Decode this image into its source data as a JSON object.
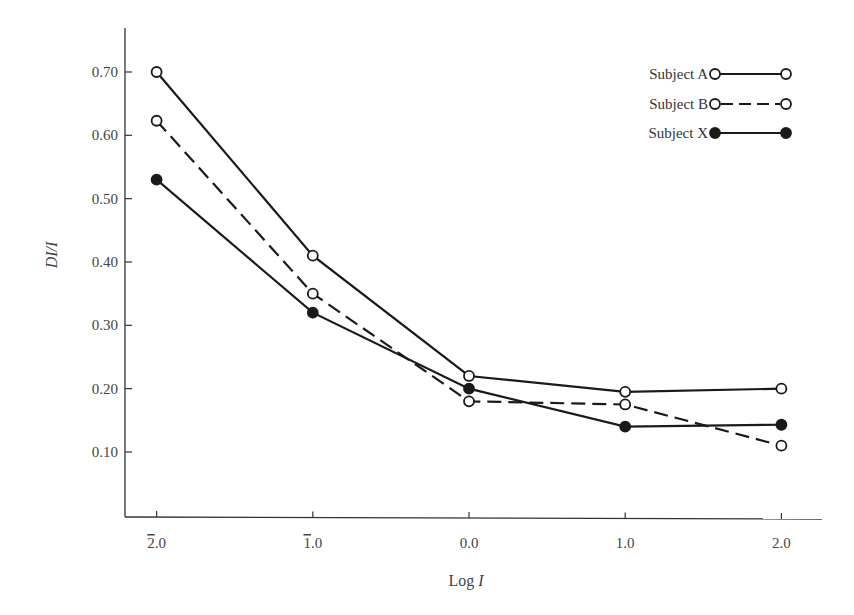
{
  "chart_data": {
    "type": "line",
    "title": "",
    "xlabel": "Log I",
    "ylabel": "DI/I",
    "x": [
      -2.0,
      -1.0,
      0.0,
      1.0,
      2.0
    ],
    "x_tick_labels": [
      "2̄.0",
      "1̄.0",
      "0.0",
      "1.0",
      "2.0"
    ],
    "y_ticks": [
      0.1,
      0.2,
      0.3,
      0.4,
      0.5,
      0.6,
      0.7
    ],
    "y_tick_labels": [
      "0.10",
      "0.20",
      "0.30",
      "0.40",
      "0.50",
      "0.60",
      "0.70"
    ],
    "ylim": [
      0.0,
      0.77
    ],
    "xlim": [
      -2.2,
      2.25
    ],
    "grid": false,
    "legend_position": "upper right",
    "series": [
      {
        "name": "Subject A",
        "values": [
          0.7,
          0.41,
          0.22,
          0.195,
          0.2
        ],
        "marker": "open-circle",
        "line": "solid"
      },
      {
        "name": "Subject B",
        "values": [
          0.623,
          0.35,
          0.18,
          0.175,
          0.11
        ],
        "marker": "open-circle",
        "line": "dashed"
      },
      {
        "name": "Subject X",
        "values": [
          0.53,
          0.32,
          0.2,
          0.14,
          0.143
        ],
        "marker": "filled-circle",
        "line": "solid"
      }
    ]
  },
  "legend": {
    "items": [
      {
        "label": "Subject A"
      },
      {
        "label": "Subject B"
      },
      {
        "label": "Subject X"
      }
    ]
  },
  "axes": {
    "x_title": "Log I",
    "y_title_main": "DI/I"
  },
  "colors": {
    "line": "#1a1a1a",
    "axis": "#333333",
    "text": "#444444"
  }
}
